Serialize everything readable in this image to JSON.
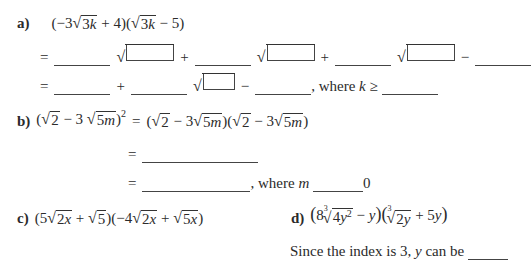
{
  "problems": {
    "a": {
      "label": "a)",
      "expression": "(−3√3k + 4)(√3k − 5)",
      "line1": {
        "eq": "=",
        "op1": "+",
        "op2": "+",
        "op3": "−"
      },
      "line2": {
        "eq": "=",
        "op1": "+",
        "op2": "−",
        "where_text": ", where",
        "var": "k",
        "rel": "≥"
      }
    },
    "b": {
      "label": "b)",
      "expression_left": "(√2 − 3 √5m)²",
      "eq": "=",
      "expression_right": "(√2 − 3√5m)(√2 − 3√5m)",
      "line2": {
        "eq": "="
      },
      "line3": {
        "eq": "=",
        "where_text": ", where",
        "var": "m",
        "tail": "0"
      }
    },
    "c": {
      "label": "c)",
      "expression": "(5√2x + √5)(−4√2x + √5x)"
    },
    "d": {
      "label": "d)",
      "expression": "(8∛4y² − y)(∛2y + 5y)",
      "note_prefix": "Since the index is 3,",
      "note_var": "y",
      "note_suffix": "can be"
    }
  }
}
